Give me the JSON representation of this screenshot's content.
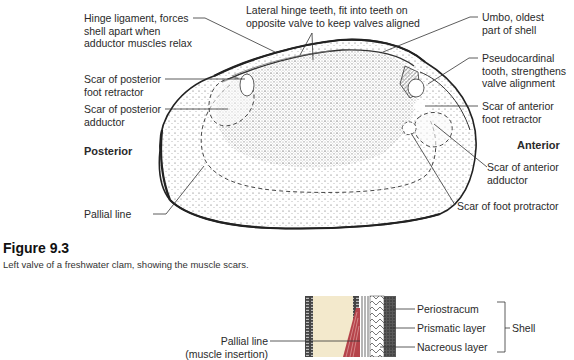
{
  "figure": {
    "number": "Figure 9.3",
    "caption": "Left valve of a freshwater clam, showing the muscle scars."
  },
  "shell_diagram": {
    "labels": {
      "hinge_ligament": "Hinge ligament, forces\nshell apart when\nadductor muscles relax",
      "lateral_hinge_teeth": "Lateral hinge teeth, fit into teeth on\nopposite valve to keep valves aligned",
      "umbo": "Umbo, oldest\npart of shell",
      "pseudocardinal_tooth": "Pseudocardinal\ntooth, strengthens\nvalve alignment",
      "scar_posterior_foot_retractor": "Scar of posterior\nfoot retractor",
      "scar_posterior_adductor": "Scar of posterior\nadductor",
      "posterior": "Posterior",
      "pallial_line": "Pallial line",
      "scar_anterior_foot_retractor": "Scar of anterior\nfoot retractor",
      "anterior": "Anterior",
      "scar_anterior_adductor": "Scar of anterior\nadductor",
      "scar_foot_protractor": "Scar of foot protractor"
    }
  },
  "cross_section": {
    "labels": {
      "pallial_line": "Pallial line\n(muscle insertion)",
      "periostracum": "Periostracum",
      "prismatic_layer": "Prismatic layer",
      "nacreous_layer": "Nacreous layer",
      "shell": "Shell"
    },
    "colors": {
      "mantle": "#f3e9cc",
      "muscle": "#b5434a",
      "dark_layer": "#3a3a3a"
    }
  }
}
